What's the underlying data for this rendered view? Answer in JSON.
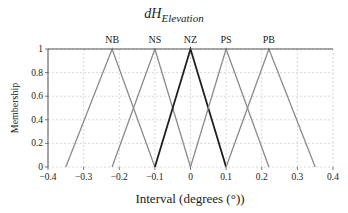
{
  "chart_data": {
    "type": "line",
    "title": "dH",
    "title_subscript": "Elevation",
    "xlabel": "Interval (degrees (°))",
    "ylabel": "Membership",
    "xlim": [
      -0.4,
      0.4
    ],
    "ylim": [
      0,
      1
    ],
    "xticks": [
      -0.4,
      -0.3,
      -0.2,
      -0.1,
      0,
      0.1,
      0.2,
      0.3,
      0.4
    ],
    "xtick_labels": [
      "−0.4",
      "−0.3",
      "−0.2",
      "−0.1",
      "0",
      "0.1",
      "0.2",
      "0.3",
      "0.4"
    ],
    "yticks": [
      0,
      0.2,
      0.4,
      0.6,
      0.8,
      1
    ],
    "ytick_labels": [
      "0",
      "0.2",
      "0.4",
      "0.6",
      "0.8",
      "1"
    ],
    "grid": true,
    "series": [
      {
        "name": "NB",
        "x": [
          -0.35,
          -0.22,
          -0.1
        ],
        "y": [
          0,
          1,
          0
        ],
        "color": "#8a8a8a",
        "width": 1.3
      },
      {
        "name": "NS",
        "x": [
          -0.22,
          -0.1,
          0
        ],
        "y": [
          0,
          1,
          0
        ],
        "color": "#8a8a8a",
        "width": 1.3
      },
      {
        "name": "NZ",
        "x": [
          -0.1,
          0,
          0.1
        ],
        "y": [
          0,
          1,
          0
        ],
        "color": "#1e1e1e",
        "width": 1.8
      },
      {
        "name": "PS",
        "x": [
          0,
          0.1,
          0.22
        ],
        "y": [
          0,
          1,
          0
        ],
        "color": "#8a8a8a",
        "width": 1.3
      },
      {
        "name": "PB",
        "x": [
          0.1,
          0.22,
          0.35
        ],
        "y": [
          0,
          1,
          0
        ],
        "color": "#8a8a8a",
        "width": 1.3
      }
    ]
  },
  "plot_area": {
    "left": 48,
    "right": 333,
    "top": 49,
    "bottom": 167
  },
  "colors": {
    "axis": "#555555",
    "grid": "#cfcfcf",
    "text": "#222222"
  }
}
